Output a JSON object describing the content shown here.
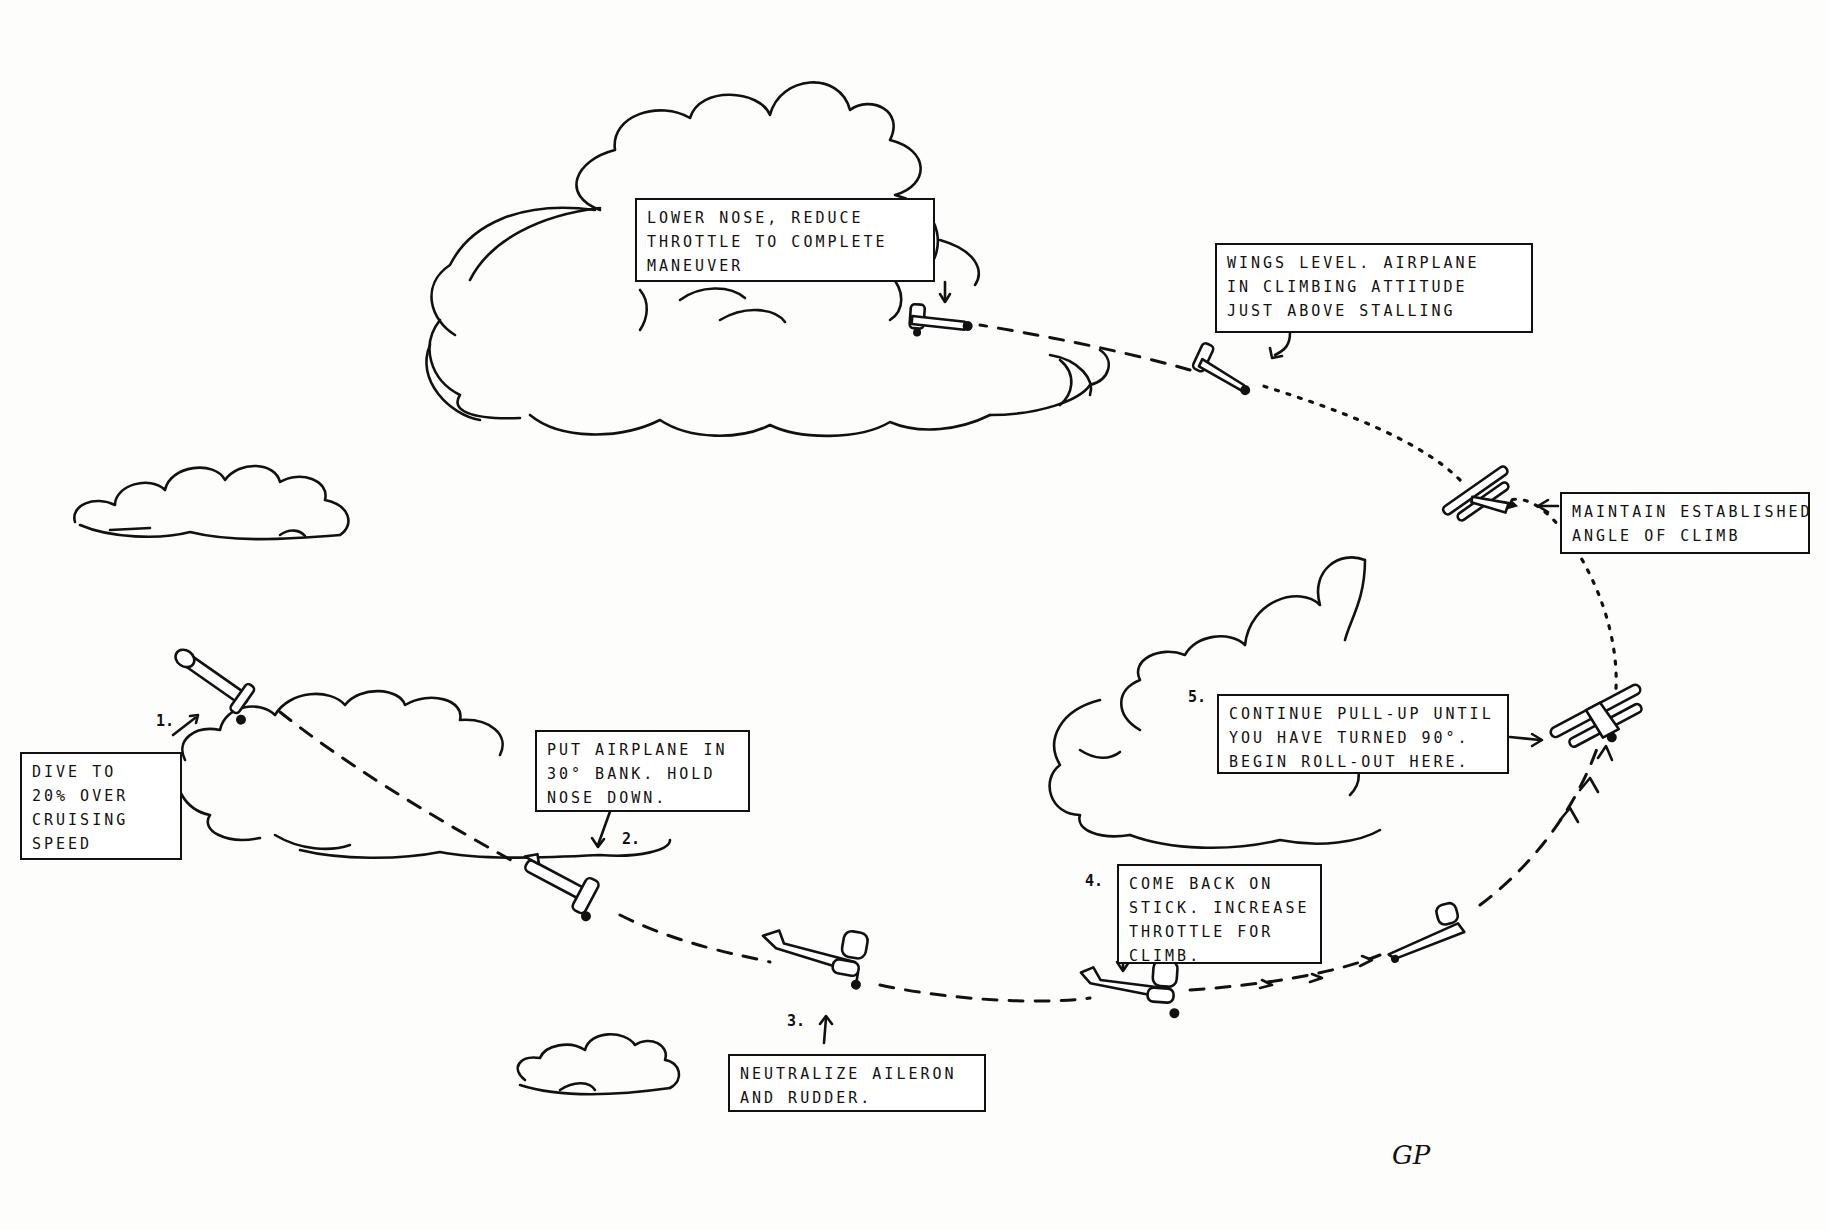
{
  "diagram": {
    "ink_color": "#111111",
    "background": "#fdfdfc",
    "callouts": [
      {
        "id": "dive",
        "step": "1.",
        "lines": [
          "Dive to",
          "20% over",
          "cruising",
          "speed"
        ]
      },
      {
        "id": "bank",
        "step": "2.",
        "lines": [
          "Put airplane in",
          "30° bank. Hold",
          "nose down."
        ]
      },
      {
        "id": "neutralize",
        "step": "3.",
        "lines": [
          "Neutralize aileron",
          "and rudder."
        ]
      },
      {
        "id": "come-back",
        "step": "4.",
        "lines": [
          "Come back on",
          "stick. Increase",
          "throttle for",
          "climb."
        ]
      },
      {
        "id": "continue",
        "step": "5.",
        "lines": [
          "Continue pull-up until",
          "you have turned 90°.",
          "Begin roll-out here."
        ]
      },
      {
        "id": "maintain",
        "step": "",
        "lines": [
          "Maintain established",
          "angle of climb"
        ]
      },
      {
        "id": "wings-level",
        "step": "",
        "lines": [
          "Wings level. Airplane",
          "in climbing attitude",
          "just above stalling"
        ]
      },
      {
        "id": "lower-nose",
        "step": "",
        "lines": [
          "Lower nose, reduce",
          "throttle to complete",
          "maneuver"
        ]
      }
    ],
    "signature": "GP",
    "airplane_positions": [
      "diving",
      "banked-descent",
      "level-low",
      "level-pullup",
      "climbing-turn",
      "steep-bank-climb",
      "inverted-view-climb",
      "near-stall",
      "wings-level-recovery"
    ]
  }
}
